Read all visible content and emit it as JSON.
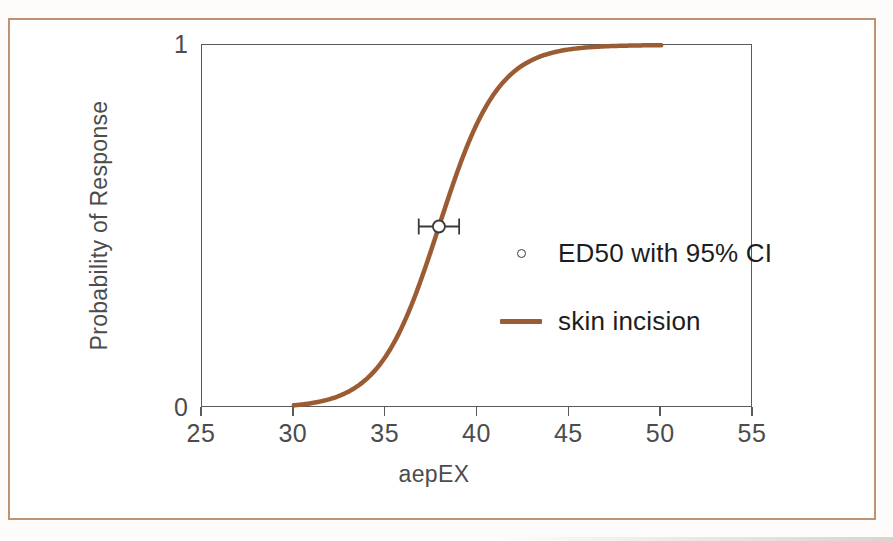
{
  "figure": {
    "width": 893,
    "height": 541,
    "border_color": "#c09274",
    "background": "#ffffff"
  },
  "chart_data": {
    "type": "line",
    "title": "",
    "xlabel": "aepEX",
    "ylabel": "Probability of Response",
    "xlim": [
      25,
      55
    ],
    "ylim": [
      0,
      1
    ],
    "xticks": [
      25,
      30,
      35,
      40,
      45,
      50,
      55
    ],
    "xticklabels": [
      "25",
      "30",
      "35",
      "40",
      "45",
      "50",
      "55"
    ],
    "yticks": [
      0,
      1
    ],
    "yticklabels": [
      "0",
      "1"
    ],
    "grid": false,
    "legend_position": "inside-center-right",
    "series": [
      {
        "name": "skin incision",
        "type": "line",
        "color": "#9c5c33",
        "linewidth": 4.5,
        "model": "logistic",
        "ed50": 37.9,
        "slope": 0.62,
        "x_start": 30,
        "x_end": 50,
        "x": [
          30,
          31,
          32,
          33,
          34,
          35,
          36,
          37,
          37.9,
          38,
          39,
          40,
          41,
          42,
          43,
          44,
          45,
          46,
          47,
          48,
          49,
          50
        ],
        "y": [
          0.007,
          0.013,
          0.024,
          0.044,
          0.079,
          0.137,
          0.227,
          0.355,
          0.5,
          0.508,
          0.661,
          0.784,
          0.87,
          0.925,
          0.958,
          0.977,
          0.987,
          0.993,
          0.996,
          0.998,
          0.999,
          1.0
        ]
      },
      {
        "name": "ED50 with 95% CI",
        "type": "errorbar-point",
        "marker": "open-circle",
        "color": "#3a3a3a",
        "x": 37.9,
        "y": 0.5,
        "ci_low": 36.8,
        "ci_high": 39.0
      }
    ],
    "annotations": []
  },
  "legend": {
    "items": [
      {
        "label": "ED50 with 95% CI",
        "swatch": "open-circle-marker",
        "color": "#3a3a3a"
      },
      {
        "label": "skin incision",
        "swatch": "line-swatch",
        "color": "#9c5c33"
      }
    ]
  },
  "axes": {
    "x_label": "aepEX",
    "y_label": "Probability of Response",
    "x_tick_labels": [
      "25",
      "30",
      "35",
      "40",
      "45",
      "50",
      "55"
    ],
    "y_tick_top": "1",
    "y_tick_bottom": "0",
    "frame_color": "#5a5a5a"
  }
}
